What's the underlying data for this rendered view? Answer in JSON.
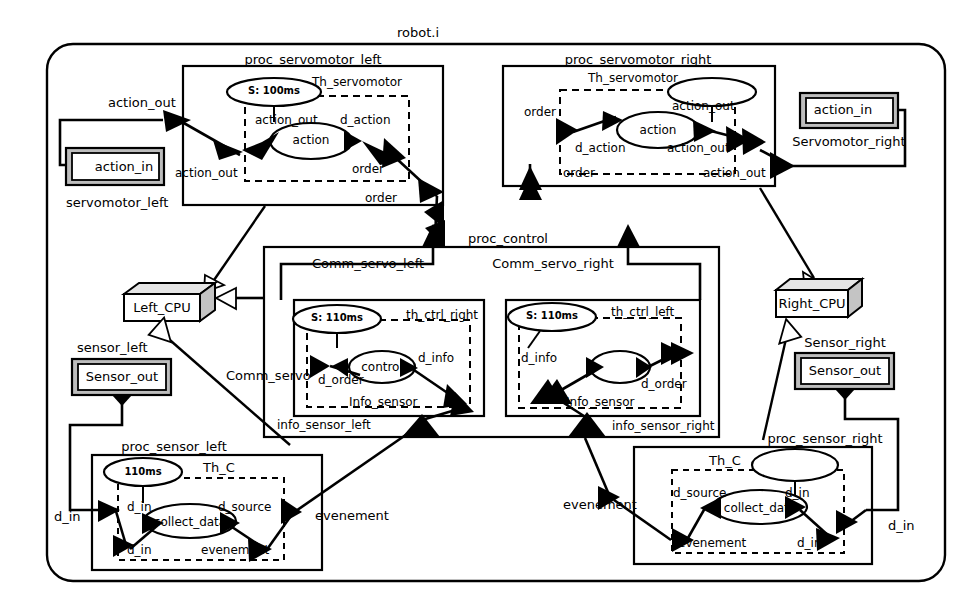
{
  "diagram": {
    "title": "robot.i",
    "type": "uml-deployment-process-diagram",
    "colors": {
      "line": "#000000",
      "background": "#ffffff",
      "node_face": "#ffffff",
      "node_shade": "#b9b9b9",
      "component_inner": "#e8e8e8"
    }
  },
  "system": {
    "name": "robot.i"
  },
  "processes": {
    "servomotor_left": {
      "name": "proc_servomotor_left",
      "thread": "Th_servomotor",
      "timer": "S: 100ms",
      "activity": "action",
      "ports": {
        "out_top": "action_out",
        "in_thread_left": "action_out",
        "act_left": "action_out",
        "act_right": "d_action",
        "order_inner": "order",
        "order_outer": "order"
      },
      "external_label": "action_out"
    },
    "servomotor_right": {
      "name": "proc_servomotor_right",
      "thread": "Th_servomotor",
      "timer": "",
      "activity": "action",
      "ports": {
        "order_inner": "order",
        "order_outer": "order",
        "act_left": "d_action",
        "act_right": "action_out",
        "out_inner": "action_out",
        "out_outer": "action_out"
      }
    },
    "control": {
      "name": "proc_control",
      "comm_left": "Comm_servo_left",
      "comm_right": "Comm_servo_right",
      "comm_servo": "Comm_servo",
      "left_thread": {
        "name": "th_ctrl_right",
        "timer": "S: 110ms",
        "activity": "control",
        "ports": {
          "d_order": "d_order",
          "d_info": "d_info",
          "info_sensor": "Info_sensor"
        },
        "external_port": "info_sensor_left"
      },
      "right_thread": {
        "name": "th_ctrl_left",
        "timer": "S: 110ms",
        "activity": "",
        "ports": {
          "d_info": "d_info",
          "d_order": "d_order",
          "info_sensor": "Info_sensor"
        },
        "external_port": "info_sensor_right"
      }
    },
    "sensor_left": {
      "name": "proc_sensor_left",
      "thread": "Th_C",
      "timer": "110ms",
      "activity": "collect_data",
      "ports": {
        "d_in_top": "d_in",
        "d_in_bottom": "d_in",
        "d_source": "d_source",
        "evenement_inner": "evenement",
        "evenement_outer": "evenement",
        "d_in_external": "d_in"
      }
    },
    "sensor_right": {
      "name": "proc_sensor_right",
      "thread": "Th_C",
      "timer": "",
      "activity": "collect_data",
      "ports": {
        "d_source": "d_source",
        "d_in_top": "d_in",
        "d_in_bottom": "d_in",
        "evenement_inner": "evenement",
        "evenement_outer": "evenement",
        "d_in_external": "d_in"
      }
    }
  },
  "devices": {
    "servomotor_left": {
      "label": "servomotor_left",
      "port": "action_in"
    },
    "servomotor_right": {
      "label": "Servomotor_right",
      "port": "action_in"
    },
    "sensor_left": {
      "label": "sensor_left",
      "port": "Sensor_out"
    },
    "sensor_right": {
      "label": "Sensor_right",
      "port": "Sensor_out"
    }
  },
  "nodes": {
    "left_cpu": "Left_CPU",
    "right_cpu": "Right_CPU"
  }
}
